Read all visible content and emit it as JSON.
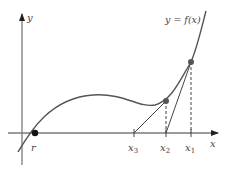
{
  "figure": {
    "axes": {
      "x_label": "x",
      "y_label": "y",
      "axis_color": "#7a7a7a"
    },
    "curve": {
      "label": "y = f(x)",
      "color": "#555555"
    },
    "points": {
      "root_label": "r",
      "x1_label": "x1",
      "x2_label": "x2",
      "x3_label": "x3",
      "point_color": "#555555",
      "root_color": "#111111"
    },
    "tangent_color": "#444444",
    "dashed_color": "#444444"
  }
}
